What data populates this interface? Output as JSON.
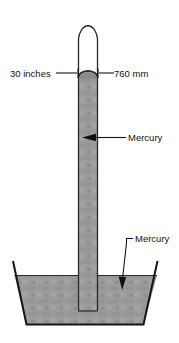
{
  "figure": {
    "labels": {
      "inches": "30 inches",
      "millimeters": "760 mm",
      "mercury_column": "Mercury",
      "mercury_reservoir": "Mercury"
    },
    "colors": {
      "mercury_fill": "#9b9b9b",
      "mercury_fill_dark": "#8f8f8f",
      "outline": "#1a1a1a",
      "background": "#ffffff",
      "text": "#111111"
    },
    "measurements": {
      "column_height_inches": "30 inches",
      "column_height_mm": "760 mm"
    },
    "parts": {
      "tube": "glass-tube",
      "vacuum": "vacuum-space",
      "column": "mercury-column",
      "dish": "mercury-dish",
      "pool": "mercury-pool"
    }
  }
}
